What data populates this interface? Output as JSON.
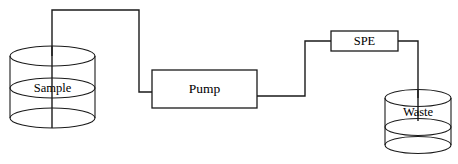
{
  "diagram": {
    "type": "process-flow",
    "stroke_color": "#1a1a1a",
    "background_color": "#ffffff",
    "nodes": [
      {
        "id": "sample",
        "label": "Sample",
        "shape": "cylinder",
        "role": "source-vessel",
        "x": 10,
        "y": 48,
        "width": 85,
        "height": 78
      },
      {
        "id": "pump",
        "label": "Pump",
        "shape": "rectangle",
        "role": "process-unit",
        "x": 152,
        "y": 70,
        "width": 105,
        "height": 38
      },
      {
        "id": "spe",
        "label": "SPE",
        "shape": "rectangle",
        "role": "process-unit",
        "x": 331,
        "y": 31,
        "width": 67,
        "height": 20
      },
      {
        "id": "waste",
        "label": "Waste",
        "shape": "cylinder",
        "role": "collection-vessel",
        "x": 385,
        "y": 90,
        "width": 66,
        "height": 66
      }
    ],
    "connections": [
      {
        "id": "sample-to-pump",
        "from": "sample",
        "to": "pump",
        "style": "orthogonal"
      },
      {
        "id": "pump-to-spe",
        "from": "pump",
        "to": "spe",
        "style": "orthogonal"
      },
      {
        "id": "spe-to-waste",
        "from": "spe",
        "to": "waste",
        "style": "orthogonal"
      }
    ]
  }
}
